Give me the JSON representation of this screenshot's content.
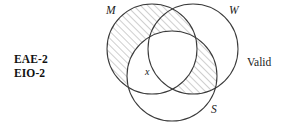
{
  "figure": {
    "type": "venn-diagram",
    "caption_left": {
      "line1": "EAE-2",
      "line2": "EIO-2"
    },
    "caption_right": "Valid",
    "existential_marker": "x",
    "background_color": "#ffffff",
    "stroke_color": "#333333",
    "hatch_color": "#8a8a8a",
    "circles": [
      {
        "label": "M",
        "name": "middle-term-circle",
        "cx": 152,
        "cy": 49,
        "r": 45,
        "label_x": 106,
        "label_y": 4
      },
      {
        "label": "W",
        "name": "major-term-circle",
        "cx": 193,
        "cy": 49,
        "r": 45,
        "label_x": 229,
        "label_y": 4
      },
      {
        "label": "S",
        "name": "minor-term-circle",
        "cx": 172,
        "cy": 76,
        "r": 45,
        "label_x": 211,
        "label_y": 103
      }
    ],
    "shaded_regions": [
      "M-minus-S",
      "W-intersect-S-minus-M"
    ]
  }
}
